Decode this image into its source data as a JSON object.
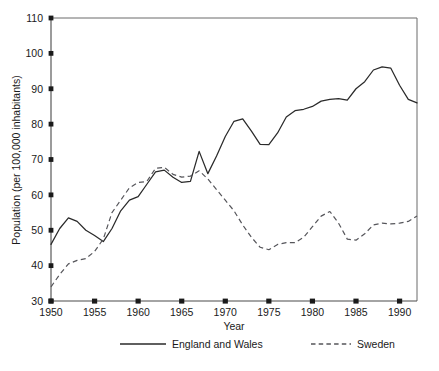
{
  "chart_data": {
    "type": "line",
    "title": "",
    "xlabel": "Year",
    "ylabel": "Population (per 100,000 inhabitants)",
    "xlim": [
      1950,
      1992
    ],
    "ylim": [
      30,
      110
    ],
    "xticks": [
      1950,
      1955,
      1960,
      1965,
      1970,
      1975,
      1980,
      1985,
      1990
    ],
    "yticks": [
      30,
      40,
      50,
      60,
      70,
      80,
      90,
      100,
      110
    ],
    "grid": false,
    "legend_position": "bottom",
    "x": [
      1950,
      1951,
      1952,
      1953,
      1954,
      1955,
      1956,
      1957,
      1958,
      1959,
      1960,
      1961,
      1962,
      1963,
      1964,
      1965,
      1966,
      1967,
      1968,
      1969,
      1970,
      1971,
      1972,
      1973,
      1974,
      1975,
      1976,
      1977,
      1978,
      1979,
      1980,
      1981,
      1982,
      1983,
      1984,
      1985,
      1986,
      1987,
      1988,
      1989,
      1990,
      1991,
      1992
    ],
    "series": [
      {
        "name": "England and Wales",
        "style": "solid",
        "color": "#2a2a2a",
        "values": [
          46.0,
          50.5,
          53.5,
          52.5,
          50.0,
          48.5,
          46.8,
          50.5,
          55.5,
          58.5,
          59.5,
          63.0,
          66.5,
          67.0,
          65.0,
          63.5,
          63.8,
          72.3,
          66.0,
          71.0,
          76.5,
          80.8,
          81.5,
          78.0,
          74.3,
          74.2,
          77.5,
          82.0,
          83.8,
          84.2,
          85.0,
          86.5,
          87.0,
          87.2,
          86.8,
          90.0,
          92.0,
          95.3,
          96.2,
          95.8,
          91.0,
          87.0,
          86.0
        ]
      },
      {
        "name": "Sweden",
        "style": "dashed",
        "color": "#55555a",
        "values": [
          34.0,
          37.5,
          40.5,
          41.5,
          42.0,
          44.0,
          47.5,
          55.0,
          58.5,
          62.0,
          63.5,
          63.8,
          67.5,
          67.8,
          65.8,
          65.0,
          65.3,
          66.8,
          64.5,
          61.5,
          58.5,
          55.5,
          51.5,
          48.0,
          45.2,
          44.5,
          46.0,
          46.5,
          46.5,
          48.0,
          51.0,
          54.0,
          55.3,
          52.0,
          47.5,
          47.2,
          49.0,
          51.5,
          52.0,
          51.8,
          52.0,
          52.5,
          54.0
        ]
      }
    ],
    "legend": [
      {
        "label": "England and Wales",
        "style": "solid"
      },
      {
        "label": "Sweden",
        "style": "dashed"
      }
    ]
  },
  "caption": {
    "text": ""
  }
}
